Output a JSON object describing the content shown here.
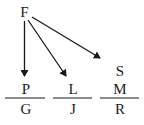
{
  "diagram": {
    "root": {
      "label": "F",
      "x": 24.5,
      "y": 16
    },
    "arrows": [
      {
        "from": "F",
        "to": "P",
        "x1": 24.5,
        "y1": 21,
        "x2": 24.5,
        "y2": 76
      },
      {
        "from": "F",
        "to": "L",
        "x1": 28,
        "y1": 20,
        "x2": 66,
        "y2": 76
      },
      {
        "from": "F",
        "to": "S",
        "x1": 32,
        "y1": 17,
        "x2": 100,
        "y2": 58
      }
    ],
    "fractions": [
      {
        "numerator": [
          "P"
        ],
        "denominator": "G",
        "cx": 25,
        "line_x1": 5,
        "line_x2": 45
      },
      {
        "numerator": [
          "L"
        ],
        "denominator": "J",
        "cx": 72,
        "line_x1": 53,
        "line_x2": 92
      },
      {
        "numerator": [
          "S",
          "M"
        ],
        "denominator": "R",
        "cx": 120,
        "line_x1": 100,
        "line_x2": 139
      }
    ],
    "line_y": 98,
    "stroke_color": "#1a1a1a"
  },
  "labels": {
    "root": "F",
    "p": "P",
    "g": "G",
    "l": "L",
    "j": "J",
    "s": "S",
    "m": "M",
    "r": "R"
  }
}
